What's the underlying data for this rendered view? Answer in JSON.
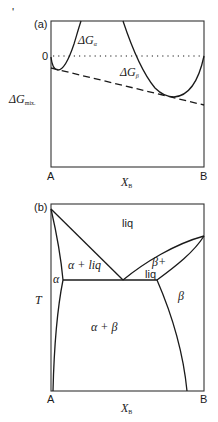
{
  "figure": {
    "stray_mark": "'",
    "panel_a": {
      "tag": "(a)",
      "zero_label": "0",
      "y_label": "ΔG",
      "y_label_sub": "mix.",
      "alpha_curve_label": "ΔG",
      "alpha_curve_sub": "α",
      "beta_curve_label": "ΔG",
      "beta_curve_sub": "β",
      "x_left": "A",
      "x_right": "B",
      "x_label": "X",
      "x_label_sub": "B",
      "lines": {
        "zero_line": "dotted",
        "common_tangent": "dashed"
      }
    },
    "panel_b": {
      "tag": "(b)",
      "y_label": "T",
      "x_left": "A",
      "x_right": "B",
      "x_label": "X",
      "x_label_sub": "B",
      "regions": {
        "liq": "liq",
        "alpha_liq": "α + liq",
        "beta_liq_1": "β+",
        "beta_liq_2": "liq",
        "alpha": "α",
        "beta": "β",
        "alpha_beta": "α + β"
      }
    }
  }
}
